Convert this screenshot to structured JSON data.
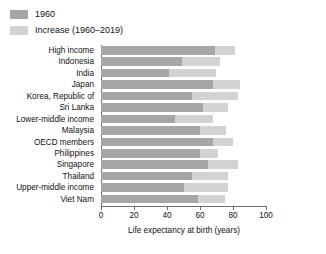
{
  "legend": {
    "items": [
      {
        "label": "1960",
        "color": "#a6a6a6",
        "key": "base"
      },
      {
        "label": "Increase (1960–2019)",
        "color": "#d2d2d2",
        "key": "increase"
      }
    ]
  },
  "axis": {
    "x_title": "Life expectancy at birth (years)",
    "ticks": [
      0,
      20,
      40,
      60,
      80,
      100
    ],
    "min": 0,
    "max": 100
  },
  "chart_data": {
    "type": "bar",
    "orientation": "horizontal",
    "stacked": true,
    "title": "",
    "xlabel": "Life expectancy at birth (years)",
    "ylabel": "",
    "xlim": [
      0,
      100
    ],
    "xticks": [
      0,
      20,
      40,
      60,
      80,
      100
    ],
    "grid": false,
    "legend_position": "top-left",
    "categories": [
      "High income",
      "Indonesia",
      "India",
      "Japan",
      "Korea, Republic of",
      "Sri Lanka",
      "Lower-middle income",
      "Malaysia",
      "OECD members",
      "Philippines",
      "Singapore",
      "Thailand",
      "Upper-middle income",
      "Viet Nam"
    ],
    "series": [
      {
        "name": "1960",
        "color": "#a6a6a6",
        "values": [
          69,
          49,
          41,
          68,
          55,
          62,
          45,
          60,
          68,
          60,
          65,
          55,
          50,
          59
        ]
      },
      {
        "name": "Increase (1960–2019)",
        "color": "#d2d2d2",
        "values": [
          12,
          23,
          29,
          16,
          28,
          15,
          23,
          16,
          12,
          11,
          18,
          22,
          27,
          16
        ]
      }
    ],
    "totals": [
      81,
      72,
      70,
      84,
      83,
      77,
      68,
      76,
      80,
      71,
      83,
      77,
      77,
      75
    ]
  }
}
